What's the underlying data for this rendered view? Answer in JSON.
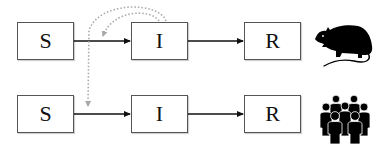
{
  "diagram": {
    "rows": [
      {
        "host": "rodent",
        "icon": "rat-icon",
        "compartments": [
          {
            "id": "S",
            "label": "S"
          },
          {
            "id": "I",
            "label": "I"
          },
          {
            "id": "R",
            "label": "R"
          }
        ]
      },
      {
        "host": "human",
        "icon": "people-group-icon",
        "compartments": [
          {
            "id": "S",
            "label": "S"
          },
          {
            "id": "I",
            "label": "I"
          },
          {
            "id": "R",
            "label": "R"
          }
        ]
      }
    ],
    "edges": [
      {
        "from": "rodent.S",
        "to": "rodent.I",
        "style": "solid"
      },
      {
        "from": "rodent.I",
        "to": "rodent.R",
        "style": "solid"
      },
      {
        "from": "human.S",
        "to": "human.I",
        "style": "solid"
      },
      {
        "from": "human.I",
        "to": "human.R",
        "style": "solid"
      },
      {
        "from": "rodent.I",
        "to": "rodent.S->I",
        "style": "dotted"
      },
      {
        "from": "rodent.I",
        "to": "human.S->I",
        "style": "dotted"
      }
    ],
    "colors": {
      "solid_arrow": "#111111",
      "dotted_arrow": "#a9a9a9",
      "box_border": "#555555",
      "icon_fill": "#000000"
    }
  }
}
